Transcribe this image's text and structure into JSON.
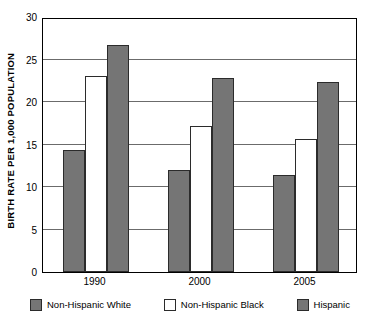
{
  "chart_data": {
    "type": "bar",
    "title": "",
    "xlabel": "",
    "ylabel": "BIRTH RATE PER 1,000 POPULATION",
    "categories": [
      "1990",
      "2000",
      "2005"
    ],
    "series": [
      {
        "name": "Non-Hispanic White",
        "color": "#757575",
        "values": [
          14.4,
          12.0,
          11.4
        ]
      },
      {
        "name": "Non-Hispanic Black",
        "color": "#ffffff",
        "values": [
          23.1,
          17.2,
          15.7
        ]
      },
      {
        "name": "Hispanic",
        "color": "#757575",
        "values": [
          26.7,
          22.8,
          22.3
        ]
      }
    ],
    "ylim": [
      0,
      30
    ],
    "ytick_labels": [
      "0",
      "5",
      "10",
      "15",
      "20",
      "25",
      "30"
    ],
    "ytick_values": [
      0,
      5,
      10,
      15,
      20,
      25,
      30
    ],
    "grid": true,
    "legend_position": "bottom"
  },
  "legend": {
    "items": [
      {
        "label": "Non-Hispanic White",
        "swatch": "gray"
      },
      {
        "label": "Non-Hispanic Black",
        "swatch": "white"
      },
      {
        "label": "Hispanic",
        "swatch": "gray"
      }
    ]
  }
}
